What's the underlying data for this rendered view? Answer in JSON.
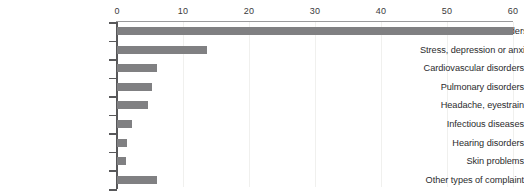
{
  "chart_data": {
    "type": "bar",
    "orientation": "horizontal",
    "title": "",
    "subtitle": "",
    "xlabel": "",
    "ylabel": "",
    "xlim": [
      0,
      60
    ],
    "xticks": [
      0,
      10,
      20,
      30,
      40,
      50,
      60
    ],
    "xticklabels": [
      "0",
      "10",
      "20",
      "30",
      "40",
      "50",
      "60"
    ],
    "grid": true,
    "grid_axis": "x",
    "legend": false,
    "legend_position": "none",
    "bar_color": "#808082",
    "axis_color": "#58585a",
    "gridline_color": "#f0f0ee",
    "categories": [
      "Musculo-skeletal disorders",
      "Stress, depression or anxiety",
      "Cardiovascular disorders",
      "Pulmonary disorders",
      "Headache, eyestrain",
      "Infectious diseases",
      "Hearing disorders",
      "Skin problems",
      "Other types of complaint"
    ],
    "values": [
      60.0,
      13.6,
      6.1,
      5.3,
      4.7,
      2.2,
      1.5,
      1.3,
      6.0
    ]
  }
}
